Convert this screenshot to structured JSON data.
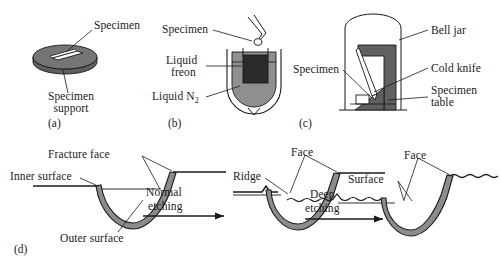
{
  "figure": {
    "colors": {
      "line": "#1a1a1a",
      "membrane_gray": "#8c8c8c",
      "ring_gray": "#707070",
      "liquid_n2_gray": "#8f8f8f",
      "freon_dark": "#2b2b2b",
      "bell_jar_dark": "#555555",
      "white": "#ffffff"
    }
  },
  "panels": {
    "a": {
      "id": "(a)",
      "name": "specimen-support-panel",
      "labels": {
        "specimen": "Specimen",
        "support_line1": "Specimen",
        "support_line2": "support"
      }
    },
    "b": {
      "id": "(b)",
      "name": "freezing-dewar-panel",
      "labels": {
        "specimen": "Specimen",
        "freon_line1": "Liquid",
        "freon_line2": "freon",
        "nitrogen": "Liquid N",
        "nitrogen_sub": "2"
      }
    },
    "c": {
      "id": "(c)",
      "name": "bell-jar-fracture-panel",
      "labels": {
        "specimen": "Specimen",
        "bell_jar": "Bell jar",
        "cold_knife": "Cold knife",
        "table_line1": "Specimen",
        "table_line2": "table"
      }
    },
    "d": {
      "id": "(d)",
      "name": "etching-sequence-panel",
      "stage1": {
        "name": "pre-etch-stage",
        "labels": {
          "fracture_face": "Fracture face",
          "inner_surface": "Inner surface",
          "outer_surface": "Outer surface"
        }
      },
      "arrow1": {
        "name": "normal-etching-arrow",
        "line1": "Normal",
        "line2": "etching"
      },
      "stage2": {
        "name": "normal-etched-stage",
        "labels": {
          "face": "Face",
          "ridge": "Ridge"
        }
      },
      "arrow2": {
        "name": "deep-etching-arrow",
        "line1": "Deep",
        "line2": "etching"
      },
      "stage3": {
        "name": "deep-etched-stage",
        "labels": {
          "face": "Face",
          "surface": "Surface"
        }
      }
    }
  }
}
